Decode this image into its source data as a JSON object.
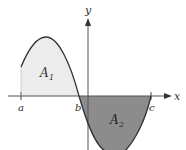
{
  "diagram": {
    "axes": {
      "x_label": "x",
      "y_label": "y"
    },
    "points": {
      "a": "a",
      "b": "b",
      "c": "c"
    },
    "regions": [
      {
        "name": "A1",
        "label": "A",
        "subscript": "1",
        "fill": "#ececec",
        "position": "above x-axis between a and b"
      },
      {
        "name": "A2",
        "label": "A",
        "subscript": "2",
        "fill": "#8c8c8c",
        "position": "below x-axis between b and c"
      }
    ],
    "colors": {
      "curve": "#333333",
      "axis": "#555555",
      "region_A1": "#ececec",
      "region_A2": "#8c8c8c"
    }
  }
}
